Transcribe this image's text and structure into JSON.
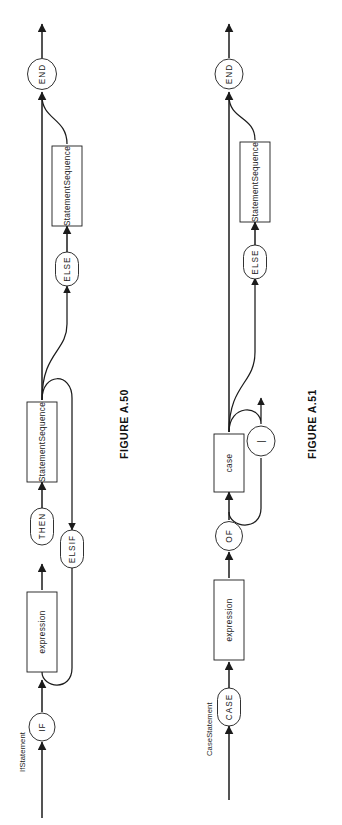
{
  "page": {
    "width": 342,
    "height": 825,
    "background": "#ffffff",
    "ink_color": "#1b1b1b",
    "orientation": "rotated-90-ccw"
  },
  "figures": [
    {
      "id": "fig-a50",
      "caption": "FIGURE A.50",
      "entry_label": "IfStatement",
      "nodes": [
        {
          "id": "if",
          "label": "IF",
          "shape": "circle"
        },
        {
          "id": "expr",
          "label": "expression",
          "shape": "rect"
        },
        {
          "id": "then",
          "label": "THEN",
          "shape": "stadium"
        },
        {
          "id": "seq1",
          "label": "StatementSequence",
          "shape": "rect"
        },
        {
          "id": "elsif",
          "label": "ELSIF",
          "shape": "stadium"
        },
        {
          "id": "else",
          "label": "ELSE",
          "shape": "stadium"
        },
        {
          "id": "seq2",
          "label": "StatementSequence",
          "shape": "rect"
        },
        {
          "id": "end",
          "label": "END",
          "shape": "circle"
        }
      ],
      "paths": [
        "IfStatement -> IF -> expression -> THEN -> StatementSequence -> END",
        "StatementSequence -> ELSIF loop back to expression",
        "StatementSequence -> ELSE -> StatementSequence -> END",
        "StatementSequence -> END (skip ELSE)"
      ]
    },
    {
      "id": "fig-a51",
      "caption": "FIGURE A.51",
      "entry_label": "CaseStatement",
      "nodes": [
        {
          "id": "case",
          "label": "CASE",
          "shape": "stadium"
        },
        {
          "id": "expr",
          "label": "expression",
          "shape": "rect"
        },
        {
          "id": "of",
          "label": "OF",
          "shape": "circle"
        },
        {
          "id": "casebox",
          "label": "case",
          "shape": "rect"
        },
        {
          "id": "bar",
          "label": "|",
          "shape": "circle"
        },
        {
          "id": "else",
          "label": "ELSE",
          "shape": "stadium"
        },
        {
          "id": "seq",
          "label": "StatementSequence",
          "shape": "rect"
        },
        {
          "id": "end",
          "label": "END",
          "shape": "circle"
        }
      ],
      "paths": [
        "CaseStatement -> CASE -> expression -> OF -> case -> END",
        "case -> | loop back to case",
        "case -> ELSE -> StatementSequence -> END",
        "case -> END (skip ELSE)"
      ]
    }
  ]
}
